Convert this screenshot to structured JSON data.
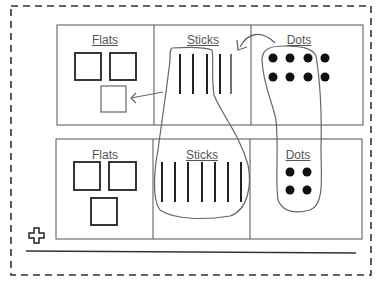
{
  "diagram": {
    "type": "place-value-regrouping-sketch",
    "rows": [
      {
        "name": "before",
        "columns": [
          {
            "label": "Flats",
            "flats": 3,
            "note": "third flat formed from regrouped sticks"
          },
          {
            "label": "Sticks",
            "sticks": 5
          },
          {
            "label": "Dots",
            "dots": 8
          }
        ]
      },
      {
        "name": "after",
        "columns": [
          {
            "label": "Flats",
            "flats": 3
          },
          {
            "label": "Sticks",
            "sticks": 7
          },
          {
            "label": "Dots",
            "dots": 4
          }
        ]
      }
    ],
    "annotations": [
      "arrow from dots to sticks",
      "arrow from sticks to flats",
      "loop around sticks across rows",
      "loop around dots across rows"
    ],
    "icons": {
      "move_handle": "plus-icon"
    },
    "colors": {
      "grid": "#555555",
      "ink": "#222222",
      "border": "#333333"
    }
  },
  "labels": {
    "r1_flats": "Flats",
    "r1_sticks": "Sticks",
    "r1_dots": "Dots",
    "r2_flats": "Flats",
    "r2_sticks": "Sticks",
    "r2_dots": "Dots"
  }
}
